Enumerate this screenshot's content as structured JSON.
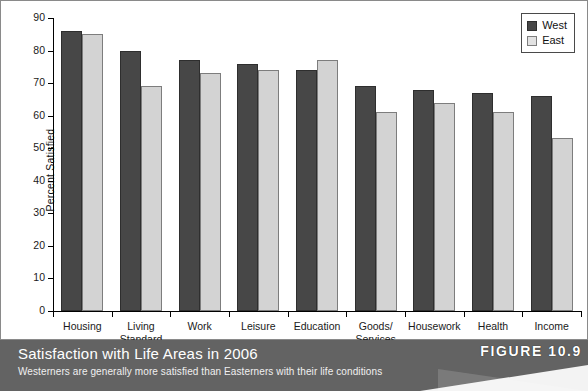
{
  "chart_data": {
    "type": "bar",
    "title": "Satisfaction with Life Areas in 2006",
    "subtitle": "Westerners are generally more satisfied than Easterners with their life conditions",
    "xlabel": "",
    "ylabel": "Percent Satisfied",
    "ylim": [
      0,
      90
    ],
    "yticks": [
      0,
      10,
      20,
      30,
      40,
      50,
      60,
      70,
      80,
      90
    ],
    "ytick_labels": [
      "0",
      "10",
      "20",
      "30",
      "40",
      "50",
      "60",
      "70",
      "80",
      "90"
    ],
    "grid": false,
    "legend_position": "top-right",
    "categories": [
      "Housing",
      "Living\nStandard",
      "Work",
      "Leisure",
      "Education",
      "Goods/\nServices",
      "Housework",
      "Health",
      "Income"
    ],
    "series": [
      {
        "name": "West",
        "color": "#474747",
        "values": [
          86,
          80,
          77,
          76,
          74,
          69,
          68,
          67,
          66
        ]
      },
      {
        "name": "East",
        "color": "#d3d3d3",
        "values": [
          85,
          69,
          73,
          74,
          77,
          61,
          64,
          61,
          53
        ]
      }
    ]
  },
  "legend": {
    "items": [
      {
        "label": "West"
      },
      {
        "label": "East"
      }
    ]
  },
  "caption": {
    "title": "Satisfaction with Life Areas in 2006",
    "subtitle": "Westerners are generally more satisfied than Easterners with their life conditions",
    "figure_badge": "FIGURE 10.9"
  },
  "colors": {
    "west_fill": "#474747",
    "east_fill": "#d3d3d3",
    "caption_bar": "#636363",
    "frame": "#8a8a8a"
  }
}
